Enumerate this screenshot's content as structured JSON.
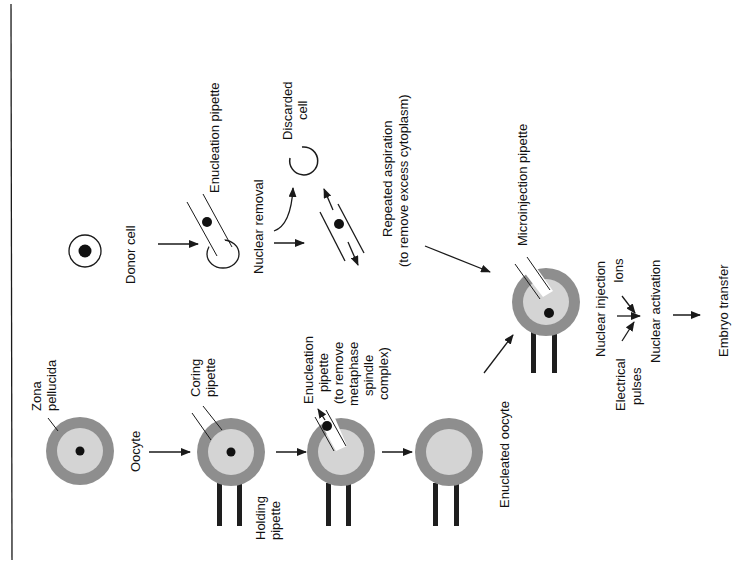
{
  "diagram": {
    "title": "",
    "orientation": "rotated-90-ccw",
    "colors": {
      "zona": "#8e8e8e",
      "cytoplasm": "#d4d4d4",
      "nucleus": "#111111",
      "line": "#1a1a1a",
      "holding_pipette": "#1e1e1e",
      "background": "#ffffff"
    },
    "labels": {
      "zona_pellucida_1": "Zona",
      "zona_pellucida_2": "pellucida",
      "oocyte": "Oocyte",
      "coring_pipette_1": "Coring",
      "coring_pipette_2": "pipette",
      "holding_pipette_1": "Holding",
      "holding_pipette_2": "pipette",
      "enucleation_1": "Enucleation",
      "enucleation_2": "pipette",
      "enucleation_3": "(to remove",
      "enucleation_4": "metaphase",
      "enucleation_5": "spindle",
      "enucleation_6": "complex)",
      "enucleated_oocyte": "Enucleated oocyte",
      "donor_cell": "Donor cell",
      "enucleation_pipette": "Enucleation pipette",
      "nuclear_removal": "Nuclear removal",
      "discarded_cell_1": "Discarded",
      "discarded_cell_2": "cell",
      "repeated_aspiration_1": "Repeated aspiration",
      "repeated_aspiration_2": "(to remove excess cytoplasm)",
      "microinjection_pipette": "Microinjection pipette",
      "nuclear_injection": "Nuclear injection",
      "ions": "Ions",
      "electrical_pulses_1": "Electrical",
      "electrical_pulses_2": "pulses",
      "nuclear_activation": "Nuclear activation",
      "embryo_transfer": "Embryo transfer"
    },
    "steps": [
      "Oocyte",
      "Coring pipette + Holding pipette",
      "Enucleation pipette (to remove metaphase spindle complex)",
      "Enucleated oocyte",
      "Donor cell",
      "Nuclear removal",
      "Repeated aspiration (to remove excess cytoplasm)",
      "Microinjection pipette",
      "Nuclear injection",
      "Nuclear activation",
      "Embryo transfer"
    ]
  }
}
